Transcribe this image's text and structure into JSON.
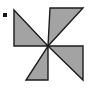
{
  "figure": {
    "name": "pinwheel",
    "title": "Pinwheel shape made of four shaded right triangles",
    "canvas": {
      "width": 93,
      "height": 91,
      "background": "#ffffff"
    },
    "colors": {
      "blade_fill": "#a3a3a3",
      "blade_stroke": "#1c1c1c",
      "bullet": "#161616",
      "background": "#ffffff"
    },
    "stroke_width": 1.4,
    "center": {
      "x": 48,
      "y": 46
    },
    "blade_count": 4,
    "blades": [
      {
        "name": "blade-top-left",
        "label": "top-left blade",
        "points": "14,10 14,46 48,46"
      },
      {
        "name": "blade-top-right",
        "label": "top-right blade",
        "points": "50,8 83,8 48,46"
      },
      {
        "name": "blade-bottom-right",
        "label": "bottom-right blade",
        "points": "48,46 83,46 83,80"
      },
      {
        "name": "blade-bottom-left",
        "label": "bottom-left blade",
        "points": "48,46 48,80 26,80"
      }
    ],
    "bullet": {
      "name": "bullet-dot",
      "label": "bullet marker",
      "x": 3,
      "y": 13,
      "width": 4,
      "height": 4
    }
  }
}
